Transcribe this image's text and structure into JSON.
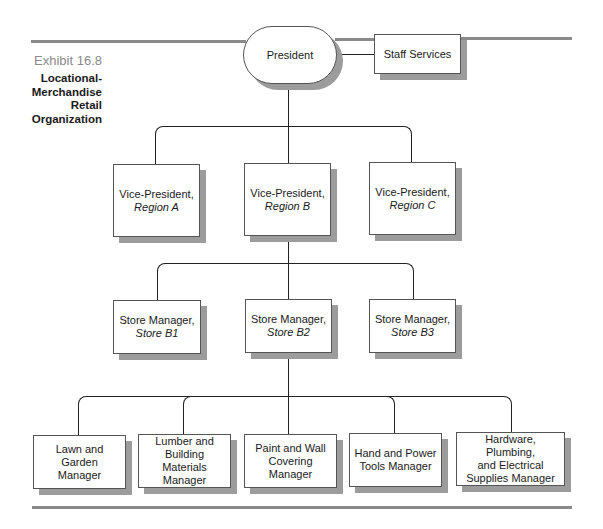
{
  "exhibit": {
    "number": "Exhibit 16.8",
    "title_lines": [
      "Locational-",
      "Merchandise",
      "Retail",
      "Organization"
    ]
  },
  "chart": {
    "top": {
      "label": "President"
    },
    "staff": {
      "label": "Staff Services"
    },
    "vice_presidents": [
      {
        "title": "Vice-President,",
        "region": "Region A"
      },
      {
        "title": "Vice-President,",
        "region": "Region B"
      },
      {
        "title": "Vice-President,",
        "region": "Region C"
      }
    ],
    "store_managers": [
      {
        "title": "Store Manager,",
        "store": "Store B1"
      },
      {
        "title": "Store Manager,",
        "store": "Store B2"
      },
      {
        "title": "Store Manager,",
        "store": "Store B3"
      }
    ],
    "department_managers": [
      {
        "lines": [
          "Lawn and Garden",
          "Manager"
        ]
      },
      {
        "lines": [
          "Lumber and",
          "Building Materials",
          "Manager"
        ]
      },
      {
        "lines": [
          "Paint and Wall",
          "Covering Manager"
        ]
      },
      {
        "lines": [
          "Hand and Power",
          "Tools Manager"
        ]
      },
      {
        "lines": [
          "Hardware, Plumbing,",
          "and Electrical",
          "Supplies Manager"
        ]
      }
    ]
  }
}
